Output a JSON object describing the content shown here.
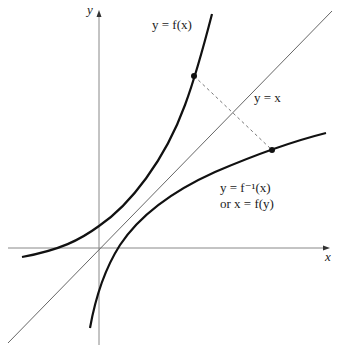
{
  "diagram": {
    "axes": {
      "x_label": "x",
      "y_label": "y",
      "origin_px": [
        99,
        248
      ]
    },
    "labels": {
      "f": "y = f(x)",
      "identity": "y = x",
      "inverse_line1": "y = f⁻¹(x)",
      "inverse_line2": "or x = f(y)"
    },
    "points": [
      {
        "name": "point-on-f",
        "px": [
          194,
          76
        ]
      },
      {
        "name": "point-on-f-inverse",
        "px": [
          272,
          150
        ]
      }
    ],
    "colors": {
      "curve": "#111111",
      "axis": "#777777",
      "identity_line": "#666666",
      "dashed": "#777777"
    }
  }
}
